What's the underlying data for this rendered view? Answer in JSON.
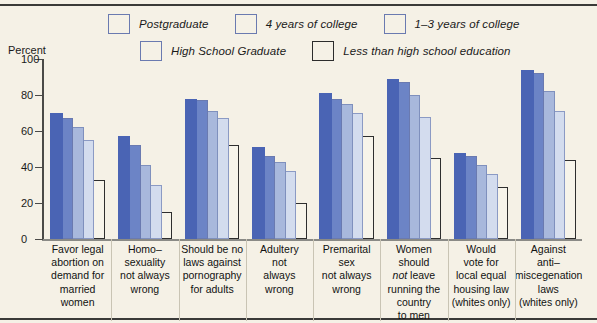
{
  "axis": {
    "percent_label": "Percent",
    "yticks": [
      0,
      20,
      40,
      60,
      80,
      100
    ]
  },
  "legend": {
    "items": [
      {
        "label": "Postgraduate",
        "color": "#4a64b4",
        "swatch": "legend-swatch-postgraduate"
      },
      {
        "label": "4 years of college",
        "color": "#6c84c6",
        "swatch": "legend-swatch-4-years-college"
      },
      {
        "label": "1–3 years of college",
        "color": "#a8b8dc",
        "swatch": "legend-swatch-1-3-years-college"
      },
      {
        "label": "High School Graduate",
        "color": "#d3dcee",
        "swatch": "legend-swatch-high-school-graduate"
      },
      {
        "label": "Less than high school education",
        "color": "#f7f4ea",
        "swatch": "legend-swatch-less-than-high-school"
      }
    ]
  },
  "chart_data": {
    "type": "bar",
    "title": "",
    "xlabel": "",
    "ylabel": "Percent",
    "ylim": [
      0,
      100
    ],
    "yticks": [
      0,
      20,
      40,
      60,
      80,
      100
    ],
    "grid": false,
    "legend_position": "top",
    "categories": [
      "Favor legal abortion on demand for married women",
      "Homo-sexuality not always wrong",
      "Should be no laws against pornography for adults",
      "Adultery not always wrong",
      "Premarital sex not always wrong",
      "Women should not leave running the country to men",
      "Would vote for local equal housing law (whites only)",
      "Against anti-miscegenation laws (whites only)"
    ],
    "category_lines": [
      [
        "Favor legal",
        "abortion on",
        "demand for",
        "married",
        "women"
      ],
      [
        "Homo–",
        "sexuality",
        "not always",
        "wrong"
      ],
      [
        "Should be no",
        "laws against",
        "pornography",
        "for adults"
      ],
      [
        "Adultery",
        "not",
        "always",
        "wrong"
      ],
      [
        "Premarital",
        "sex",
        "not always",
        "wrong"
      ],
      [
        "Women should",
        "<i>not</i> leave",
        "running the",
        "country",
        "to men"
      ],
      [
        "Would",
        "vote for",
        "local equal",
        "housing law",
        "(whites only)"
      ],
      [
        "Against",
        "anti–",
        "miscegenation",
        "laws",
        "(whites only)"
      ]
    ],
    "series": [
      {
        "name": "Postgraduate",
        "color": "#4a64b4",
        "values": [
          70,
          57,
          78,
          51,
          81,
          89,
          48,
          94
        ]
      },
      {
        "name": "4 years of college",
        "color": "#6c84c6",
        "values": [
          67,
          52,
          77,
          46,
          78,
          87,
          46,
          92
        ]
      },
      {
        "name": "1–3 years of college",
        "color": "#a8b8dc",
        "values": [
          62,
          41,
          71,
          43,
          75,
          80,
          41,
          82
        ]
      },
      {
        "name": "High School Graduate",
        "color": "#d3dcee",
        "values": [
          55,
          30,
          67,
          38,
          70,
          68,
          36,
          71
        ]
      },
      {
        "name": "Less than high school education",
        "color": "#f7f4ea",
        "values": [
          33,
          15,
          52,
          20,
          57,
          45,
          29,
          44
        ]
      }
    ]
  }
}
